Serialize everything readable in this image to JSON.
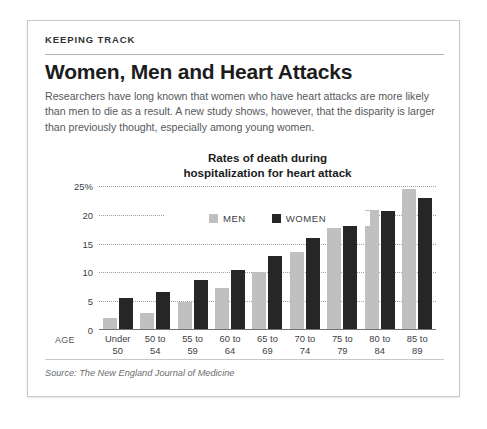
{
  "panel": {
    "kicker": "KEEPING TRACK",
    "headline": "Women, Men and Heart Attacks",
    "deck": "Researchers have long known that women who have heart attacks are more likely than men to die as a result. A new study shows, however, that the disparity is larger than previously thought, especially among  young women.",
    "source": "Source: The New England Journal of Medicine",
    "age_axis_label": "AGE"
  },
  "colors": {
    "men_bar": "#c0c0c0",
    "women_bar": "#262626",
    "gridline": "#9aa0a4",
    "panel_border": "#c8c8c8",
    "headline_text": "#1c1c1c",
    "body_text": "#55595c"
  },
  "chart_data": {
    "type": "bar",
    "title": "Rates of death during hospitalization for heart attack",
    "title_line1": "Rates of death during",
    "title_line2": "hospitalization for heart attack",
    "xlabel": "AGE",
    "ylabel": "",
    "ylim": [
      0,
      25
    ],
    "ytick_values": [
      0,
      5,
      10,
      15,
      20,
      25
    ],
    "ytick_labels": [
      "0",
      "5",
      "10",
      "15",
      "20",
      "25%"
    ],
    "grid": true,
    "legend_position": "top-center",
    "categories": [
      "Under 50",
      "50 to 54",
      "55 to 59",
      "60 to 64",
      "65 to 69",
      "70 to 74",
      "75 to 79",
      "80 to 84",
      "85 to 89"
    ],
    "category_lines": [
      [
        "Under",
        "50"
      ],
      [
        "50 to",
        "54"
      ],
      [
        "55 to",
        "59"
      ],
      [
        "60 to",
        "64"
      ],
      [
        "65 to",
        "69"
      ],
      [
        "70 to",
        "74"
      ],
      [
        "75 to",
        "79"
      ],
      [
        "80 to",
        "84"
      ],
      [
        "85 to",
        "89"
      ]
    ],
    "series": [
      {
        "name": "MEN",
        "color": "#c0c0c0",
        "values": [
          2.0,
          3.0,
          4.8,
          7.3,
          10.0,
          13.5,
          17.7,
          20.8,
          24.4
        ]
      },
      {
        "name": "WOMEN",
        "color": "#262626",
        "values": [
          5.5,
          6.6,
          8.6,
          10.5,
          12.8,
          15.9,
          18.3,
          20.7,
          23.0
        ]
      }
    ]
  }
}
